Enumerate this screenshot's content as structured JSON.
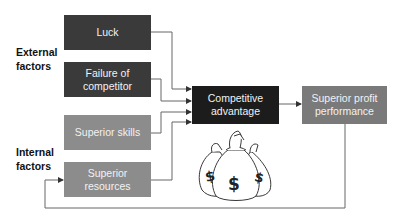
{
  "group_labels": {
    "external": "External factors",
    "external_line1": "External",
    "external_line2": "factors",
    "internal_line1": "Internal",
    "internal_line2": "factors"
  },
  "nodes": {
    "luck": "Luck",
    "failure_line1": "Failure of",
    "failure_line2": "competitor",
    "skills": "Superior skills",
    "resources_line1": "Superior",
    "resources_line2": "resources",
    "advantage_line1": "Competitive",
    "advantage_line2": "advantage",
    "profit_line1": "Superior profit",
    "profit_line2": "performance"
  },
  "illustration": {
    "name": "money-bags",
    "symbol": "$"
  },
  "colors": {
    "external_box": "#3a3a3a",
    "internal_box": "#8c8c8c",
    "advantage_box": "#1c1c1c",
    "profit_box": "#7a7a7a",
    "line": "#555555"
  }
}
